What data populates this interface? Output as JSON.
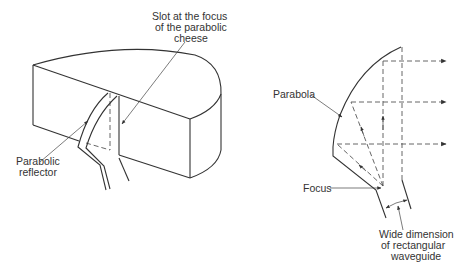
{
  "left_diagram": {
    "title": "Parabolic cheese antenna (3D view)",
    "labels": {
      "slot_line1": "Slot at the focus",
      "slot_line2": "of the parabolic",
      "slot_line3": "cheese",
      "reflector_line1": "Parabolic",
      "reflector_line2": "reflector"
    }
  },
  "right_diagram": {
    "title": "Parabolic cheese cross-section",
    "labels": {
      "parabola": "Parabola",
      "focus": "Focus",
      "waveguide_line1": "Wide dimension",
      "waveguide_line2": "of rectangular",
      "waveguide_line3": "waveguide"
    }
  },
  "colors": {
    "line": "#333333",
    "background": "#ffffff"
  }
}
